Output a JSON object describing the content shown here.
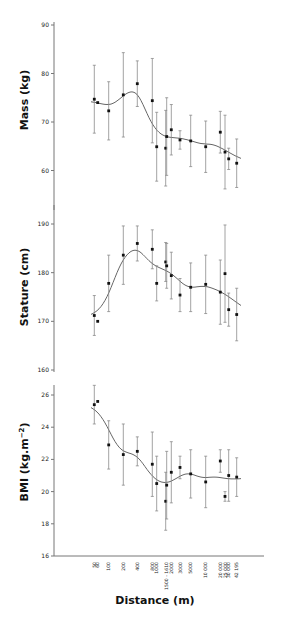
{
  "figure": {
    "xlabel": "Distance (m)"
  },
  "chart_data": [
    {
      "type": "scatter",
      "title": "",
      "panel": "mass",
      "xlabel": "Distance (m)",
      "ylabel": "Mass (kg)",
      "ylim": [
        53,
        90
      ],
      "yticks": [
        60,
        70,
        80,
        90
      ],
      "grid": false,
      "x": [
        "50",
        "60",
        "100",
        "200",
        "400",
        "800",
        "1000",
        "1500-1610",
        "1500-1610",
        "2000",
        "3000",
        "5000",
        "10 000",
        "20 000",
        "25 000",
        "30 000",
        "42 195"
      ],
      "values": [
        74.7,
        74.0,
        72.3,
        75.6,
        77.9,
        74.4,
        64.9,
        64.6,
        67.0,
        68.4,
        66.3,
        66.1,
        64.9,
        67.9,
        63.8,
        62.4,
        61.5
      ],
      "error": [
        7.0,
        0,
        6.0,
        8.7,
        4.7,
        8.7,
        7.1,
        7.8,
        8.0,
        5.2,
        1.9,
        5.3,
        5.3,
        4.3,
        7.6,
        2.2,
        5.0
      ],
      "fit": "smooth polynomial trend line"
    },
    {
      "type": "scatter",
      "title": "",
      "panel": "stature",
      "xlabel": "Distance (m)",
      "ylabel": "Stature (cm)",
      "ylim": [
        160,
        193
      ],
      "yticks": [
        160,
        170,
        180,
        190
      ],
      "grid": false,
      "x": [
        "50",
        "60",
        "100",
        "200",
        "400",
        "800",
        "1000",
        "1500-1610",
        "1500-1610",
        "2000",
        "3000",
        "5000",
        "10 000",
        "20 000",
        "25 000",
        "30 000",
        "42 195"
      ],
      "values": [
        171.2,
        170.0,
        177.8,
        183.6,
        186.0,
        184.8,
        177.8,
        182.2,
        181.4,
        179.4,
        175.4,
        177.0,
        177.6,
        176.0,
        179.8,
        172.4,
        171.4
      ],
      "error": [
        4.1,
        0,
        5.8,
        6.0,
        3.6,
        4.0,
        3.6,
        4.0,
        4.6,
        4.8,
        3.4,
        5.0,
        6.0,
        6.6,
        10.0,
        3.4,
        5.4
      ],
      "fit": "smooth polynomial trend line"
    },
    {
      "type": "scatter",
      "title": "",
      "panel": "bmi",
      "xlabel": "Distance (m)",
      "ylabel": "BMI (kg.m⁻²)",
      "ylim": [
        16,
        26.7
      ],
      "yticks": [
        16,
        18,
        20,
        22,
        24,
        26
      ],
      "grid": false,
      "x": [
        "50",
        "60",
        "100",
        "200",
        "400",
        "800",
        "1000",
        "1500-1610",
        "1500-1610",
        "2000",
        "3000",
        "5000",
        "10 000",
        "20 000",
        "25 000",
        "30 000",
        "42 195"
      ],
      "values": [
        25.4,
        25.6,
        22.9,
        22.3,
        22.5,
        21.7,
        20.5,
        19.4,
        20.4,
        21.2,
        21.5,
        21.1,
        20.6,
        21.9,
        19.7,
        21.0,
        20.9
      ],
      "error": [
        1.2,
        0,
        1.5,
        1.9,
        0.9,
        2.0,
        1.7,
        1.8,
        2.1,
        1.9,
        0.7,
        1.5,
        1.6,
        0.7,
        0.3,
        1.6,
        1.2
      ],
      "fit": "smooth polynomial trend line"
    }
  ],
  "x_tick_labels": [
    "50",
    "60",
    "100",
    "200",
    "400",
    "800",
    "1000",
    "1500 - 1610",
    "2000",
    "3000",
    "5000",
    "10 000",
    "20 000",
    "25 000",
    "30 000",
    "42 195"
  ],
  "colors": {
    "axis": "#777777",
    "points": "#111111",
    "error_bars": "#8a8a8a",
    "fit_line": "#666666",
    "text": "#111111"
  }
}
